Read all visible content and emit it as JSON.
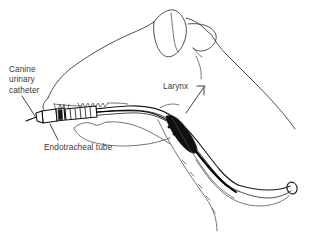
{
  "figure": {
    "background_color": "#ffffff",
    "line_color": "#3c3c3c",
    "text_color": "#3a3a3a",
    "catheter_color": "#000000",
    "width": 331,
    "height": 243
  },
  "labels": {
    "canine_catheter": {
      "line1": "Canine",
      "line2": "urinary",
      "line3": "catheter",
      "full": "Canine urinary catheter"
    },
    "endotracheal_tube": "Endotracheal tube",
    "larynx": "Larynx"
  },
  "parts": [
    {
      "name": "dog-head-outline",
      "label": "Dog head lateral outline"
    },
    {
      "name": "ear",
      "label": "Ear"
    },
    {
      "name": "muzzle",
      "label": "Muzzle"
    },
    {
      "name": "teeth",
      "label": "Teeth"
    },
    {
      "name": "tongue",
      "label": "Tongue"
    },
    {
      "name": "endotracheal-tube",
      "label": "Endotracheal tube"
    },
    {
      "name": "urinary-catheter",
      "label": "Canine urinary catheter"
    },
    {
      "name": "larynx",
      "label": "Larynx"
    },
    {
      "name": "trachea",
      "label": "Trachea"
    },
    {
      "name": "tube-connector",
      "label": "Tube connector adapter"
    }
  ]
}
